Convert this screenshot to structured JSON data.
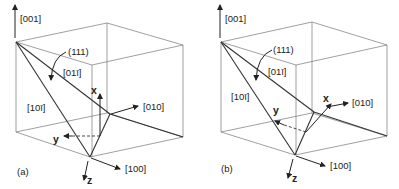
{
  "figure": {
    "panels": [
      {
        "id": "a",
        "panel_label": "(a)",
        "crystal_axes": {
          "c001": "[001]",
          "c010": "[010]",
          "c100": "[100]"
        },
        "plane_label": "(111)",
        "edge_labels": {
          "e01m1": "[01ī]",
          "e10m1": "[10ī]"
        },
        "sample_axes": {
          "x": "x",
          "y": "y",
          "z": "z"
        }
      },
      {
        "id": "b",
        "panel_label": "(b)",
        "crystal_axes": {
          "c001": "[001]",
          "c010": "[010]",
          "c100": "[100]"
        },
        "plane_label": "(111)",
        "edge_labels": {
          "e01m1": "[01ī]",
          "e10m1": "[10ī]"
        },
        "sample_axes": {
          "x": "x",
          "y": "y",
          "z": "z"
        }
      }
    ]
  }
}
